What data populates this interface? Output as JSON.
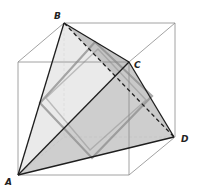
{
  "diagram": {
    "vertices": {
      "A": {
        "label": "A",
        "x": 18,
        "y": 175,
        "label_x": 5,
        "label_y": 185
      },
      "B": {
        "label": "B",
        "x": 64,
        "y": 23,
        "label_x": 54,
        "label_y": 19
      },
      "C": {
        "label": "C",
        "x": 129,
        "y": 62,
        "label_x": 134,
        "label_y": 68
      },
      "D": {
        "label": "D",
        "x": 174,
        "y": 137,
        "label_x": 181,
        "label_y": 142
      }
    },
    "cube": {
      "front": [
        [
          18,
          62
        ],
        [
          129,
          62
        ],
        [
          129,
          175
        ],
        [
          18,
          175
        ]
      ],
      "back": [
        [
          64,
          23
        ],
        [
          175,
          23
        ],
        [
          175,
          137
        ],
        [
          64,
          137
        ]
      ]
    },
    "colors": {
      "cube_edge": "#8a8a8a",
      "tetra_edge": "#1e1e1e",
      "face_light": "#e4e4e4",
      "face_mid": "#cfcfcf",
      "face_dark": "#b3b3b3",
      "section_bar": "#8c8c8c"
    }
  }
}
